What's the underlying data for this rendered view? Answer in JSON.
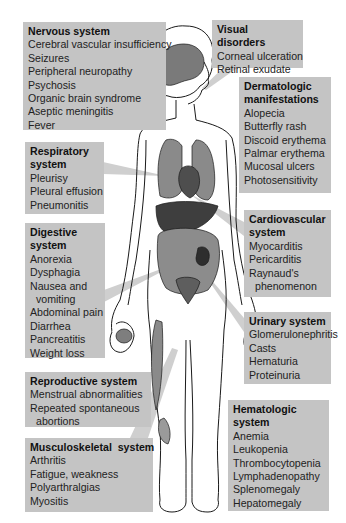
{
  "diagram": {
    "colors": {
      "box_fill": "#c4c4c4",
      "pointer_fill": "#d0d0d0",
      "organ_fill": "#6e6e6e",
      "outline": "#1a1a1a",
      "background": "#ffffff"
    },
    "boxes": {
      "nervous": {
        "title": "Nervous system",
        "items": [
          "Cerebral vascular insufficiency",
          "Seizures",
          "Peripheral neuropathy",
          "Psychosis",
          "Organic brain syndrome",
          "Aseptic meningitis",
          "Fever"
        ]
      },
      "visual": {
        "title": "Visual disorders",
        "items": [
          "Corneal ulceration",
          "Retinal exudate"
        ]
      },
      "dermatologic": {
        "title_line1": "Dermatologic",
        "title_line2": "manifestations",
        "items": [
          "Alopecia",
          "Butterfly rash",
          "Discoid erythema",
          "Palmar erythema",
          "Mucosal ulcers",
          "Photosensitivity"
        ]
      },
      "respiratory": {
        "title_line1": "Respiratory",
        "title_line2": "system",
        "items": [
          "Pleurisy",
          "Pleural effusion",
          "Pneumonitis"
        ]
      },
      "digestive": {
        "title_line1": "Digestive",
        "title_line2": "system",
        "items": [
          "Anorexia",
          "Dysphagia",
          "Nausea and",
          "vomiting",
          "Abdominal pain",
          "Diarrhea",
          "Pancreatitis",
          "Weight loss"
        ]
      },
      "cardiovascular": {
        "title_line1": "Cardiovascular",
        "title_line2": "system",
        "items": [
          "Myocarditis",
          "Pericarditis",
          "Raynaud's",
          "phenomenon"
        ]
      },
      "urinary": {
        "title": "Urinary system",
        "items": [
          "Glomerulonephritis",
          "Casts",
          "Hematuria",
          "Proteinuria"
        ]
      },
      "reproductive": {
        "title": "Reproductive system",
        "items": [
          "Menstrual abnormalities",
          "Repeated spontaneous",
          "abortions"
        ]
      },
      "musculoskeletal": {
        "title": "Musculoskeletal  system",
        "items": [
          "Arthritis",
          "Fatigue, weakness",
          "Polyarthralgias",
          "Myositis"
        ]
      },
      "hematologic": {
        "title_line1": "Hematologic",
        "title_line2": "system",
        "items": [
          "Anemia",
          "Leukopenia",
          "Thrombocytopenia",
          "Lymphadenopathy",
          "Splenomegaly",
          "Hepatomegaly"
        ]
      }
    }
  }
}
